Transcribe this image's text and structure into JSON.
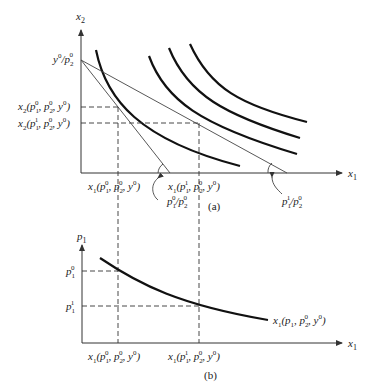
{
  "panel_a": {
    "caption": "(a)",
    "y_axis_label": "x",
    "y_axis_sub": "2",
    "x_axis_label": "x",
    "x_axis_sub": "1",
    "intercept_label": {
      "a": "y",
      "a_sup": "0",
      "b": "/p",
      "b_sub": "2",
      "b_sup": "0"
    },
    "x2_at_p1_0": {
      "fn": "x",
      "fn_sub": "2",
      "p1_sup": "0",
      "p2_sup": "0",
      "y_sup": "0"
    },
    "x2_at_p1_1": {
      "fn": "x",
      "fn_sub": "2",
      "p1_sup": "1",
      "p2_sup": "0",
      "y_sup": "0"
    },
    "x1_at_p1_0": {
      "fn": "x",
      "fn_sub": "1",
      "p1_sup": "0",
      "p2_sup": "0",
      "y_sup": "0"
    },
    "x1_at_p1_1": {
      "fn": "x",
      "fn_sub": "1",
      "p1_sup": "1",
      "p2_sup": "0",
      "y_sup": "0"
    },
    "slope_0": {
      "num_sup": "0",
      "den_sup": "0"
    },
    "slope_1": {
      "num_sup": "1",
      "den_sup": "0"
    },
    "indifference_curves": 4,
    "budget_lines": 2
  },
  "panel_b": {
    "caption": "(b)",
    "y_axis_label": "p",
    "y_axis_sub": "1",
    "x_axis_label": "x",
    "x_axis_sub": "1",
    "p1_0": {
      "sup": "0"
    },
    "p1_1": {
      "sup": "1"
    },
    "demand_curve_label": {
      "fn": "x",
      "fn_sub": "1",
      "p2_sup": "0",
      "y_sup": "0"
    },
    "x1_at_p1_0": {
      "fn": "x",
      "fn_sub": "1",
      "p1_sup": "0",
      "p2_sup": "0",
      "y_sup": "0"
    },
    "x1_at_p1_1": {
      "fn": "x",
      "fn_sub": "1",
      "p1_sup": "1",
      "p2_sup": "0",
      "y_sup": "0"
    }
  }
}
